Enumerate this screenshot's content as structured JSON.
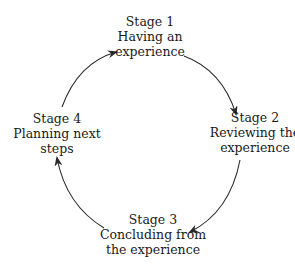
{
  "diagram": {
    "type": "cycle",
    "text_color": "#1a1a1a",
    "arrow_color": "#2a2a2a",
    "stages": [
      {
        "title": "Stage 1",
        "lines": [
          "Having an",
          "experience"
        ]
      },
      {
        "title": "Stage 2",
        "lines": [
          "Reviewing the",
          "experience"
        ]
      },
      {
        "title": "Stage 3",
        "lines": [
          "Concluding from",
          "the experience"
        ]
      },
      {
        "title": "Stage 4",
        "lines": [
          "Planning next",
          "steps"
        ]
      }
    ],
    "edges": [
      {
        "from": "Stage 1",
        "to": "Stage 2"
      },
      {
        "from": "Stage 2",
        "to": "Stage 3"
      },
      {
        "from": "Stage 3",
        "to": "Stage 4"
      },
      {
        "from": "Stage 4",
        "to": "Stage 1"
      }
    ]
  }
}
